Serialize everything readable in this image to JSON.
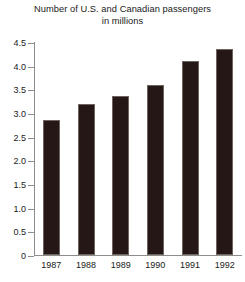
{
  "chart_data": {
    "type": "bar",
    "title": "Number of U.S. and Canadian passengers in millions",
    "title_line1": "Number of U.S. and Canadian passengers",
    "title_line2": "in millions",
    "xlabel": "",
    "ylabel": "",
    "categories": [
      "1987",
      "1988",
      "1989",
      "1990",
      "1991",
      "1992"
    ],
    "values": [
      2.85,
      3.2,
      3.35,
      3.6,
      4.1,
      4.35
    ],
    "ylim": [
      0,
      4.5
    ],
    "ytick_labels": [
      "0",
      "0.5",
      "1.0",
      "1.5",
      "2.0",
      "2.5",
      "3.0",
      "3.5",
      "4.0",
      "4.5"
    ],
    "ytick_values": [
      0,
      0.5,
      1.0,
      1.5,
      2.0,
      2.5,
      3.0,
      3.5,
      4.0,
      4.5
    ],
    "grid": false,
    "legend": null,
    "bar_color": "#241715",
    "axis_color": "#8d8d8d",
    "background": "#ffffff"
  }
}
